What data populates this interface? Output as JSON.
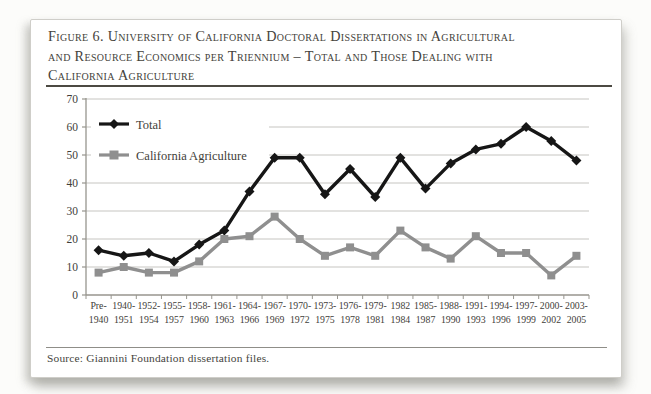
{
  "figure": {
    "title_lines": [
      "Figure 6. University of California Doctoral Dissertations in Agricultural",
      "and Resource Economics per Triennium – Total and Those Dealing with",
      "California Agriculture"
    ],
    "source": "Source: Giannini Foundation dissertation files."
  },
  "chart_data": {
    "type": "line",
    "title": "Figure 6. University of California Doctoral Dissertations in Agricultural and Resource Economics per Triennium – Total and Those Dealing with California Agriculture",
    "xlabel": "",
    "ylabel": "",
    "ylim": [
      0,
      70
    ],
    "yticks": [
      0,
      10,
      20,
      30,
      40,
      50,
      60,
      70
    ],
    "grid": true,
    "legend_position": "top-left-inside",
    "categories": [
      "Pre-1940",
      "1940-1951",
      "1952-1954",
      "1955-1957",
      "1958-1960",
      "1961-1963",
      "1964-1966",
      "1967-1969",
      "1970-1972",
      "1973-1975",
      "1976-1978",
      "1979-1981",
      "1982-1984",
      "1985-1987",
      "1988-1990",
      "1991-1993",
      "1994-1996",
      "1997-1999",
      "2000-2002",
      "2003-2005"
    ],
    "category_labels_two_line": [
      [
        "Pre-",
        "1940"
      ],
      [
        "1940-",
        "1951"
      ],
      [
        "1952-",
        "1954"
      ],
      [
        "1955-",
        "1957"
      ],
      [
        "1958-",
        "1960"
      ],
      [
        "1961-",
        "1963"
      ],
      [
        "1964-",
        "1966"
      ],
      [
        "1967-",
        "1969"
      ],
      [
        "1970-",
        "1972"
      ],
      [
        "1973-",
        "1975"
      ],
      [
        "1976-",
        "1978"
      ],
      [
        "1979-",
        "1981"
      ],
      [
        "1982",
        "1984"
      ],
      [
        "1985-",
        "1987"
      ],
      [
        "1988-",
        "1990"
      ],
      [
        "1991-",
        "1993"
      ],
      [
        "1994-",
        "1996"
      ],
      [
        "1997-",
        "1999"
      ],
      [
        "2000-",
        "2002"
      ],
      [
        "2003-",
        "2005"
      ]
    ],
    "series": [
      {
        "name": "Total",
        "marker": "diamond",
        "color": "#161616",
        "values": [
          16,
          14,
          15,
          12,
          18,
          23,
          37,
          49,
          49,
          36,
          45,
          35,
          49,
          38,
          47,
          52,
          54,
          60,
          55,
          48
        ]
      },
      {
        "name": "California Agriculture",
        "marker": "square",
        "color": "#8f8f8f",
        "values": [
          8,
          10,
          8,
          8,
          12,
          20,
          21,
          28,
          20,
          14,
          17,
          14,
          23,
          17,
          13,
          21,
          15,
          15,
          7,
          14
        ]
      }
    ]
  },
  "colors": {
    "gridline": "#c6c5c1",
    "axis": "#97958e",
    "tick_label": "#3f3e39",
    "title_text": "#44423b",
    "page_bg": "#ffffff"
  }
}
